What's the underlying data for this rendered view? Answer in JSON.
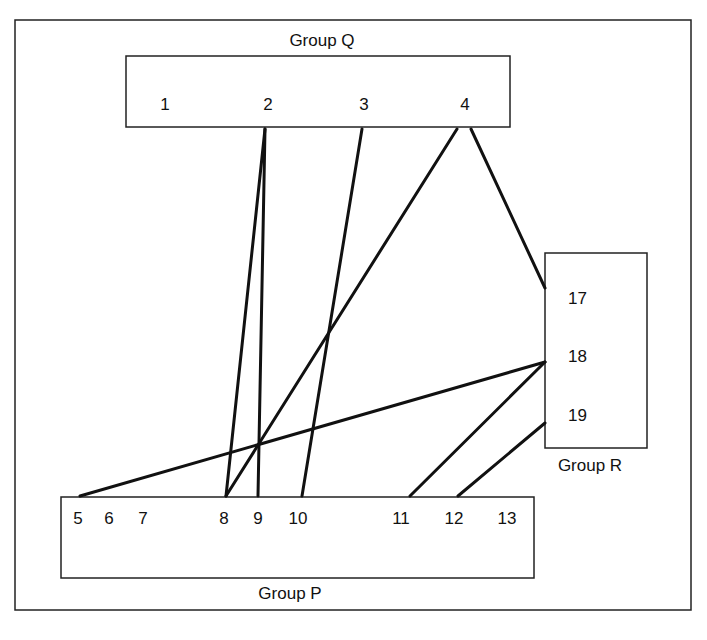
{
  "groups": {
    "Q": {
      "title": "Group Q",
      "nodes": [
        "1",
        "2",
        "3",
        "4"
      ]
    },
    "R": {
      "title": "Group R",
      "nodes": [
        "17",
        "18",
        "19"
      ]
    },
    "P": {
      "title": "Group P",
      "nodes": [
        "5",
        "6",
        "7",
        "8",
        "9",
        "10",
        "11",
        "12",
        "13"
      ]
    }
  },
  "connections": [
    {
      "from": "2",
      "to": "8"
    },
    {
      "from": "2",
      "to": "9"
    },
    {
      "from": "3",
      "to": "10"
    },
    {
      "from": "4",
      "to": "8"
    },
    {
      "from": "4",
      "to": "17"
    },
    {
      "from": "18",
      "to": "5"
    },
    {
      "from": "18",
      "to": "11"
    },
    {
      "from": "19",
      "to": "12"
    }
  ]
}
